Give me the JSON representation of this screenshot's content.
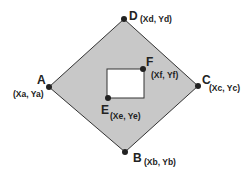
{
  "diagram": {
    "colors": {
      "fill": "#c8c8c8",
      "stroke": "#333333",
      "point": "#222222",
      "inner_fill": "#ffffff"
    },
    "points": {
      "A": {
        "label": "A",
        "coords": "(Xa, Ya)"
      },
      "B": {
        "label": "B",
        "coords": "(Xb, Yb)"
      },
      "C": {
        "label": "C",
        "coords": "(Xc, Yc)"
      },
      "D": {
        "label": "D",
        "coords": "(Xd, Yd)"
      },
      "E": {
        "label": "E",
        "coords": "(Xe, Ye)"
      },
      "F": {
        "label": "F",
        "coords": "(Xf, Yf)"
      }
    }
  }
}
